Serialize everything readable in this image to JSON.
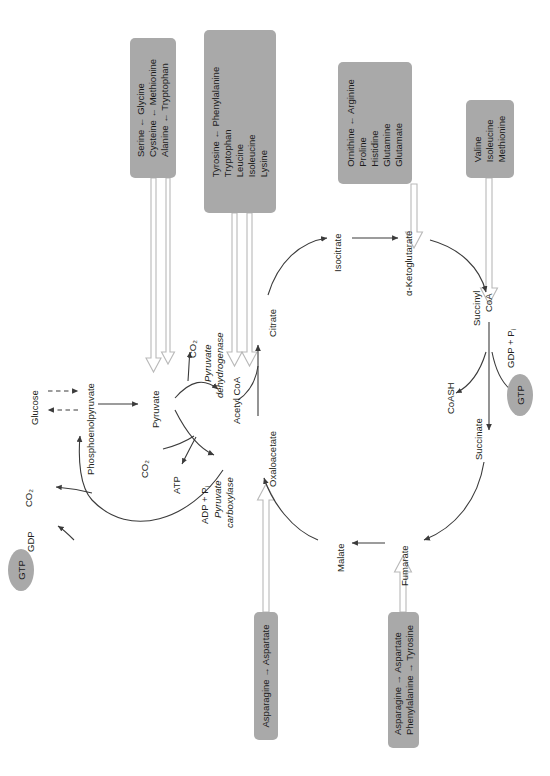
{
  "diagram": {
    "type": "metabolic-pathway",
    "palette": {
      "box_fill": "#a9a9a9",
      "oval_fill": "#a9a9a9",
      "line": "#3b3b3b",
      "hollow_arrow_fill": "#ffffff",
      "hollow_arrow_stroke": "#b9b9b9",
      "text": "#231f20"
    }
  },
  "amino_acid_boxes": [
    {
      "id": "box-serine-group",
      "rows": [
        "Serine ← Glycine",
        "Cysteine ← Methionine",
        "Alanine ← Tryptophan"
      ],
      "targets": [
        "Pyruvate"
      ]
    },
    {
      "id": "box-tyrosine-group",
      "rows": [
        "Tyrosine ← Phenylalanine",
        "Tryptophan",
        "Leucine",
        "Isoleucine",
        "Lysine"
      ],
      "targets": [
        "Acetyl CoA"
      ]
    },
    {
      "id": "box-glutamate-group",
      "rows": [
        "Ornithine ← Arginine",
        "Proline",
        "Histidine",
        "Glutamine",
        "Glutamate"
      ],
      "targets": [
        "α-Ketoglutarate"
      ]
    },
    {
      "id": "box-valine-group",
      "rows": [
        "Valine",
        "Isoleucine",
        "Methionine"
      ],
      "targets": [
        "Succinyl CoA"
      ]
    },
    {
      "id": "box-asparagine-aspartate",
      "rows": [
        "Asparagine → Aspartate"
      ],
      "targets": [
        "Oxaloacetate"
      ]
    },
    {
      "id": "box-asparagine-phenylalanine",
      "rows": [
        "Asparagine → Aspartate",
        "Phenylalanine → Tyrosine"
      ],
      "targets": [
        "Fumarate"
      ]
    }
  ],
  "metabolites": {
    "glucose": "Glucose",
    "pep": "Phosphoenolpyruvate",
    "pyruvate": "Pyruvate",
    "acetyl_coa": "Acetyl CoA",
    "oxaloacetate": "Oxaloacetate",
    "citrate": "Citrate",
    "isocitrate": "Isocitrate",
    "ketoglutarate": "α-Ketoglutarate",
    "succinyl_coa_line1": "Succinyl",
    "succinyl_coa_line2": "CoA",
    "succinate": "Succinate",
    "fumarate": "Fumarate",
    "malate": "Malate"
  },
  "cofactors": {
    "co2_pdh": "CO₂",
    "co2_pc": "CO₂",
    "co2_pepck": "CO₂",
    "atp": "ATP",
    "adp_pi": "ADP + P",
    "adp_pi_sub": "i",
    "gdp": "GDP",
    "gtp_left": "GTP",
    "gtp_right": "GTP",
    "gdp_pi": "GDP + P",
    "gdp_pi_sub": "i",
    "coash": "CoASH"
  },
  "enzymes": {
    "pdh_line1": "Pyruvate",
    "pdh_line2": "dehydrogenase",
    "pc_line1": "Pyruvate",
    "pc_line2": "carboxylase"
  }
}
